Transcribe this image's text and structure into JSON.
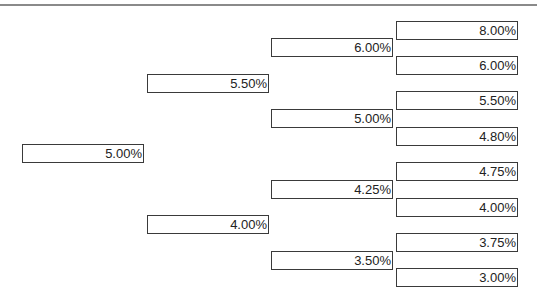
{
  "diagram": {
    "type": "binomial-interest-rate-tree",
    "levels": [
      {
        "step": 0,
        "nodes": [
          {
            "label": "5.00%",
            "x": 22,
            "y": 144
          }
        ]
      },
      {
        "step": 1,
        "nodes": [
          {
            "label": "5.50%",
            "x": 147,
            "y": 74
          },
          {
            "label": "4.00%",
            "x": 147,
            "y": 215
          }
        ]
      },
      {
        "step": 2,
        "nodes": [
          {
            "label": "6.00%",
            "x": 271,
            "y": 38
          },
          {
            "label": "5.00%",
            "x": 271,
            "y": 109
          },
          {
            "label": "4.25%",
            "x": 271,
            "y": 180
          },
          {
            "label": "3.50%",
            "x": 271,
            "y": 251
          }
        ]
      },
      {
        "step": 3,
        "nodes": [
          {
            "label": "8.00%",
            "x": 396,
            "y": 21
          },
          {
            "label": "6.00%",
            "x": 396,
            "y": 56
          },
          {
            "label": "5.50%",
            "x": 396,
            "y": 91
          },
          {
            "label": "4.80%",
            "x": 396,
            "y": 127
          },
          {
            "label": "4.75%",
            "x": 396,
            "y": 162
          },
          {
            "label": "4.00%",
            "x": 396,
            "y": 198
          },
          {
            "label": "3.75%",
            "x": 396,
            "y": 233
          },
          {
            "label": "3.00%",
            "x": 396,
            "y": 268
          }
        ]
      }
    ]
  },
  "colors": {
    "border": "#3a3a3a",
    "text": "#222222",
    "rule": "#8a8a8a",
    "background": "#ffffff"
  }
}
